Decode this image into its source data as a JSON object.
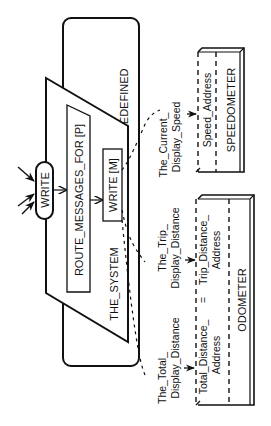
{
  "diagram": {
    "orientation": "rotated-90-ccw",
    "nodes": {
      "predefined": {
        "label": "PREDEFINED"
      },
      "the_system": {
        "label": "THE_SYSTEM"
      },
      "write_entry": {
        "label": "WRITE"
      },
      "route_messages": {
        "label": "ROUTE_MESSAGES_FOR [P]"
      },
      "write_m": {
        "label": "WRITE [M]"
      },
      "speedometer": {
        "label": "SPEEDOMETER",
        "fields": [
          "Speed_Address"
        ]
      },
      "odometer": {
        "label": "ODOMETER",
        "fields": [
          {
            "line1": "Total_Distance_",
            "line2": "Address"
          },
          {
            "line1": "Trip_Distance_",
            "line2": "Address"
          }
        ],
        "separator": "="
      }
    },
    "flows": [
      {
        "line1": "The_Current_",
        "line2": "Display_Speed",
        "to": "Speed_Address"
      },
      {
        "line1": "The_Trip_",
        "line2": "Display_Distance",
        "to": "Trip_Distance_Address"
      },
      {
        "line1": "The_Total_",
        "line2": "Display_Distance",
        "to": "Total_Distance_Address"
      }
    ]
  }
}
